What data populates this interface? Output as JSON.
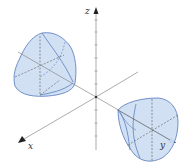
{
  "diagram": {
    "type": "3d-axes-with-surfaces",
    "axes": {
      "x_label": "x",
      "y_label": "y",
      "z_label": "z"
    },
    "colors": {
      "surface_fill": "#cfe0f3",
      "surface_stroke": "#5b7fbf",
      "axis": "#777777",
      "arrow": "#222222"
    },
    "surfaces": [
      {
        "name": "left-blob",
        "position": "upper-left, along negative y / positive x direction"
      },
      {
        "name": "right-blob",
        "position": "lower-right, along positive y axis"
      }
    ]
  }
}
